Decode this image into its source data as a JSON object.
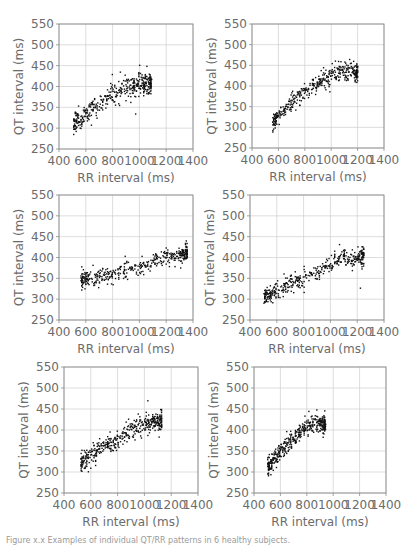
{
  "caption": "Figure x.x Examples of individual QT/RR patterns in 6 healthy subjects.",
  "chart_data": [
    {
      "type": "scatter",
      "panel": 1,
      "xlabel": "RR interval (ms)",
      "ylabel": "QT interval (ms)",
      "xlim": [
        400,
        1400
      ],
      "ylim": [
        250,
        550
      ],
      "xticks": [
        400,
        600,
        800,
        1000,
        1200,
        1400
      ],
      "yticks": [
        250,
        300,
        350,
        400,
        450,
        500,
        550
      ],
      "grid": true,
      "trend": [
        [
          520,
          310
        ],
        [
          650,
          345
        ],
        [
          800,
          380
        ],
        [
          900,
          400
        ],
        [
          1000,
          405
        ],
        [
          1090,
          410
        ]
      ],
      "rr_range": [
        510,
        1090
      ],
      "qt_spread": 12,
      "n_points": 420
    },
    {
      "type": "scatter",
      "panel": 2,
      "xlabel": "RR interval (ms)",
      "ylabel": "QT interval (ms)",
      "xlim": [
        400,
        1400
      ],
      "ylim": [
        250,
        550
      ],
      "xticks": [
        400,
        600,
        800,
        1000,
        1200,
        1400
      ],
      "yticks": [
        250,
        300,
        350,
        400,
        450,
        500,
        550
      ],
      "grid": true,
      "trend": [
        [
          560,
          312
        ],
        [
          700,
          360
        ],
        [
          850,
          395
        ],
        [
          1000,
          425
        ],
        [
          1100,
          440
        ],
        [
          1200,
          430
        ]
      ],
      "rr_range": [
        555,
        1200
      ],
      "qt_spread": 11,
      "n_points": 420
    },
    {
      "type": "scatter",
      "panel": 3,
      "xlabel": "RR interval (ms)",
      "ylabel": "QT interval (ms)",
      "xlim": [
        400,
        1400
      ],
      "ylim": [
        250,
        550
      ],
      "xticks": [
        400,
        600,
        800,
        1000,
        1200,
        1400
      ],
      "yticks": [
        250,
        300,
        350,
        400,
        450,
        500,
        550
      ],
      "grid": true,
      "trend": [
        [
          570,
          345
        ],
        [
          750,
          355
        ],
        [
          900,
          370
        ],
        [
          1050,
          385
        ],
        [
          1200,
          400
        ],
        [
          1360,
          410
        ]
      ],
      "rr_range": [
        565,
        1360
      ],
      "qt_spread": 10,
      "n_points": 420
    },
    {
      "type": "scatter",
      "panel": 4,
      "xlabel": "RR interval (ms)",
      "ylabel": "QT interval (ms)",
      "xlim": [
        400,
        1400
      ],
      "ylim": [
        250,
        550
      ],
      "xticks": [
        400,
        600,
        800,
        1000,
        1200,
        1400
      ],
      "yticks": [
        250,
        300,
        350,
        400,
        450,
        500,
        550
      ],
      "grid": true,
      "trend": [
        [
          510,
          305
        ],
        [
          650,
          330
        ],
        [
          800,
          350
        ],
        [
          950,
          375
        ],
        [
          1100,
          398
        ],
        [
          1250,
          398
        ]
      ],
      "rr_range": [
        505,
        1250
      ],
      "qt_spread": 11,
      "n_points": 420
    },
    {
      "type": "scatter",
      "panel": 5,
      "xlabel": "RR interval (ms)",
      "ylabel": "QT interval (ms)",
      "xlim": [
        400,
        1400
      ],
      "ylim": [
        250,
        550
      ],
      "xticks": [
        400,
        600,
        800,
        1000,
        1200,
        1400
      ],
      "yticks": [
        250,
        300,
        350,
        400,
        450,
        500,
        550
      ],
      "grid": true,
      "trend": [
        [
          530,
          318
        ],
        [
          650,
          350
        ],
        [
          800,
          378
        ],
        [
          950,
          410
        ],
        [
          1050,
          418
        ],
        [
          1130,
          420
        ]
      ],
      "rr_range": [
        525,
        1130
      ],
      "qt_spread": 11,
      "n_points": 420
    },
    {
      "type": "scatter",
      "panel": 6,
      "xlabel": "RR interval (ms)",
      "ylabel": "QT interval (ms)",
      "xlim": [
        400,
        1400
      ],
      "ylim": [
        250,
        550
      ],
      "xticks": [
        400,
        600,
        800,
        1000,
        1200,
        1400
      ],
      "yticks": [
        250,
        300,
        350,
        400,
        450,
        500,
        550
      ],
      "grid": true,
      "trend": [
        [
          505,
          315
        ],
        [
          600,
          350
        ],
        [
          700,
          380
        ],
        [
          800,
          408
        ],
        [
          880,
          418
        ],
        [
          940,
          412
        ]
      ],
      "rr_range": [
        505,
        940
      ],
      "qt_spread": 10,
      "n_points": 420
    }
  ],
  "layout": {
    "panels": [
      {
        "x": 59,
        "y": 24,
        "w": 134,
        "h": 125
      },
      {
        "x": 252,
        "y": 24,
        "w": 132,
        "h": 124
      },
      {
        "x": 59,
        "y": 195,
        "w": 134,
        "h": 125
      },
      {
        "x": 250,
        "y": 195,
        "w": 134,
        "h": 125
      },
      {
        "x": 64,
        "y": 367,
        "w": 134,
        "h": 126
      },
      {
        "x": 254,
        "y": 367,
        "w": 132,
        "h": 126
      }
    ]
  },
  "colors": {
    "point": "#111111",
    "frame": "#8a8a8a",
    "grid": "#cfcfcf",
    "text": "#6b6b6b"
  }
}
